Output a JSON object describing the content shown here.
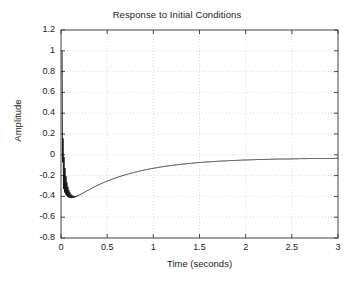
{
  "chart_data": {
    "type": "line",
    "title": "Response to Initial Conditions",
    "xlabel": "Time (seconds)",
    "ylabel": "Amplitude",
    "xlim": [
      0,
      3
    ],
    "ylim": [
      -0.8,
      1.2
    ],
    "xticks": [
      0,
      0.5,
      1,
      1.5,
      2,
      2.5,
      3
    ],
    "xticklabels": [
      "0",
      "0.5",
      "1",
      "1.5",
      "2",
      "2.5",
      "3"
    ],
    "yticks": [
      1.2,
      1,
      0.8,
      0.6,
      0.4,
      0.2,
      0,
      -0.2,
      -0.4,
      -0.6,
      -0.8
    ],
    "yticklabels": [
      "1.2",
      "1",
      "0.8",
      "0.6",
      "0.4",
      "0.2",
      "0",
      "-0.2",
      "-0.4",
      "-0.6",
      "-0.8"
    ],
    "grid": true,
    "grid_style": "dotted",
    "grid_color": "#c8c8c8",
    "axis_color": "#444444",
    "line_color": "#000000",
    "line_width": 0.8,
    "legend": null,
    "series": [
      {
        "name": "response",
        "envelope_min": -0.47,
        "envelope_max": 1.0,
        "ring_frequency_hz": 95,
        "ring_decay_tau": 0.035,
        "slow_decay_tau": 0.62,
        "slow_offset": -0.52,
        "start_time": 0.012,
        "final_value": -0.03
      }
    ]
  }
}
